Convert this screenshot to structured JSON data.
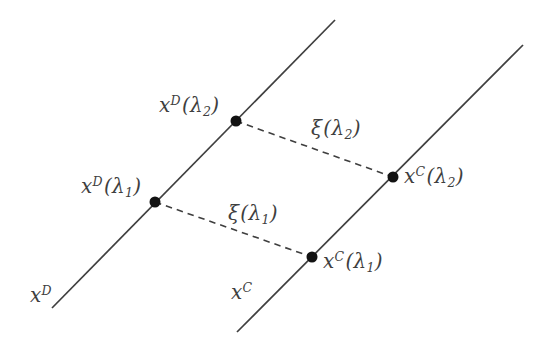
{
  "colors": {
    "ink": "#3f3f3f",
    "dot": "#121212",
    "background": "#ffffff"
  },
  "labels": {
    "point_d2": {
      "base": "x",
      "sup": "D",
      "open": "(λ",
      "sub": "2",
      "close": ")"
    },
    "point_d1": {
      "base": "x",
      "sup": "D",
      "open": "(λ",
      "sub": "1",
      "close": ")"
    },
    "point_c2": {
      "base": "x",
      "sup": "C",
      "open": "(λ",
      "sub": "2",
      "close": ")"
    },
    "point_c1": {
      "base": "x",
      "sup": "C",
      "open": "(λ",
      "sub": "1",
      "close": ")"
    },
    "xi2": {
      "base": "ξ",
      "sup": "",
      "open": "(λ",
      "sub": "2",
      "close": ")"
    },
    "xi1": {
      "base": "ξ",
      "sup": "",
      "open": "(λ",
      "sub": "1",
      "close": ")"
    },
    "line_d": {
      "base": "x",
      "sup": "D",
      "open": "",
      "sub": "",
      "close": ""
    },
    "line_c": {
      "base": "x",
      "sup": "C",
      "open": "",
      "sub": "",
      "close": ""
    }
  }
}
